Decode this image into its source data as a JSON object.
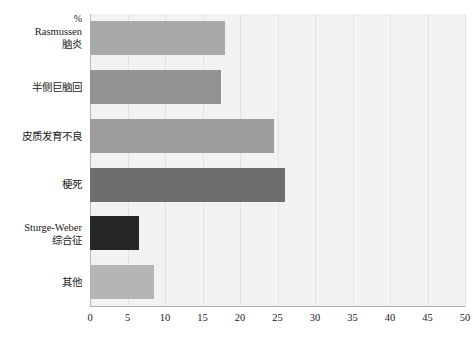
{
  "chart_data": {
    "type": "bar",
    "orientation": "horizontal",
    "title": "",
    "xlabel": "",
    "ylabel": "",
    "unit_label": "%",
    "categories": [
      "Rasmussen 脑炎",
      "半侧巨脑回",
      "皮质发育不良",
      "梗死",
      "Sturge-Weber 综合征",
      "其他"
    ],
    "values": [
      18,
      17.5,
      24.5,
      26,
      6.5,
      8.5
    ],
    "xlim": [
      0,
      50
    ],
    "xticks": [
      0,
      5,
      10,
      15,
      20,
      25,
      30,
      35,
      40,
      45,
      50
    ],
    "grid": true,
    "legend": "none",
    "bar_colors": [
      "#a9a9a9",
      "#939393",
      "#9d9d9d",
      "#6e6e6e",
      "#262626",
      "#b5b5b5"
    ],
    "plot_background": "#f2f2f2"
  },
  "labels": {
    "unit": "%",
    "categories": [
      {
        "line1": "Rasmussen",
        "line2": "脑炎"
      },
      {
        "line1": "半侧巨脑回",
        "line2": ""
      },
      {
        "line1": "皮质发育不良",
        "line2": ""
      },
      {
        "line1": "梗死",
        "line2": ""
      },
      {
        "line1": "Sturge-Weber",
        "line2": "综合征"
      },
      {
        "line1": "其他",
        "line2": ""
      }
    ],
    "xticks": [
      "0",
      "5",
      "10",
      "15",
      "20",
      "25",
      "30",
      "35",
      "40",
      "45",
      "50"
    ]
  }
}
